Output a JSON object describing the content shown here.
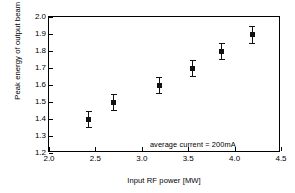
{
  "chart_data": {
    "type": "scatter",
    "title": "",
    "xlabel": "Input RF power [MW]",
    "ylabel": "Peak energy of output beam [MeV]",
    "xlim": [
      2.0,
      4.5
    ],
    "ylim": [
      1.2,
      2.0
    ],
    "xticks": [
      "2.0",
      "2.5",
      "3.0",
      "3.5",
      "4.0",
      "4.5"
    ],
    "xtick_values": [
      2.0,
      2.5,
      3.0,
      3.5,
      4.0,
      4.5
    ],
    "yticks": [
      "1.2",
      "1.3",
      "1.4",
      "1.5",
      "1.6",
      "1.7",
      "1.8",
      "1.9",
      "2.0"
    ],
    "ytick_values": [
      1.2,
      1.3,
      1.4,
      1.5,
      1.6,
      1.7,
      1.8,
      1.9,
      2.0
    ],
    "grid": false,
    "legend": null,
    "annotations": [
      {
        "text": "average current = 200mA",
        "x": 3.55,
        "y": 1.255
      }
    ],
    "series": [
      {
        "name": "peak energy vs input RF power",
        "marker": "square",
        "color": "#111111",
        "points": [
          {
            "x": 2.43,
            "y": 1.4,
            "yerr": 0.045
          },
          {
            "x": 2.7,
            "y": 1.5,
            "yerr": 0.045
          },
          {
            "x": 3.19,
            "y": 1.6,
            "yerr": 0.045
          },
          {
            "x": 3.55,
            "y": 1.7,
            "yerr": 0.045
          },
          {
            "x": 3.86,
            "y": 1.8,
            "yerr": 0.045
          },
          {
            "x": 4.19,
            "y": 1.9,
            "yerr": 0.05
          }
        ]
      }
    ]
  }
}
